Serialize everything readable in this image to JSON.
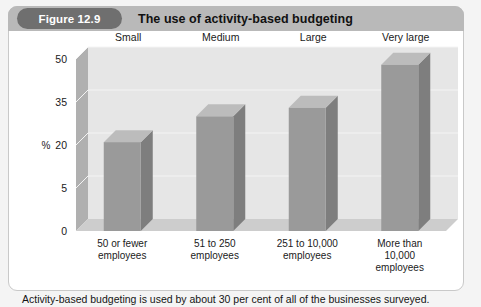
{
  "figure": {
    "badge": "Figure 12.9",
    "title": "The use of activity-based budgeting",
    "caption": "Activity-based budgeting is used by about 30 per cent of all of the businesses surveyed."
  },
  "colors": {
    "badge_bg": "#6f6f6f",
    "header_bg": "#b9b9b9",
    "bar_front": "#9a9a9a",
    "bar_side": "#7e7e7e",
    "bar_top": "#bcbcbc",
    "plot_bg": "#e6e6e6",
    "wall_side": "#b0b0b0",
    "floor": "#cdcdcd",
    "gridline": "#f4f4f4",
    "text": "#1a1a1a"
  },
  "chart_data": {
    "type": "bar",
    "title": "The use of activity-based budgeting",
    "xlabel": "",
    "ylabel": "%",
    "ylim": [
      0,
      50
    ],
    "grid": true,
    "legend": "none",
    "ytick_labels": [
      "0",
      "5",
      "20",
      "35",
      "50"
    ],
    "ytick_values": [
      0,
      5,
      20,
      35,
      50
    ],
    "categories": [
      "50 or fewer employees",
      "51 to 250 employees",
      "251 to 10,000 employees",
      "More than 10,000 employees"
    ],
    "category_lines": [
      [
        "50 or fewer",
        "employees"
      ],
      [
        "51 to 250",
        "employees"
      ],
      [
        "251 to 10,000",
        "employees"
      ],
      [
        "More than",
        "10,000",
        "employees"
      ]
    ],
    "top_labels": [
      "Small",
      "Medium",
      "Large",
      "Very large"
    ],
    "values": [
      21,
      30,
      33,
      48
    ]
  }
}
